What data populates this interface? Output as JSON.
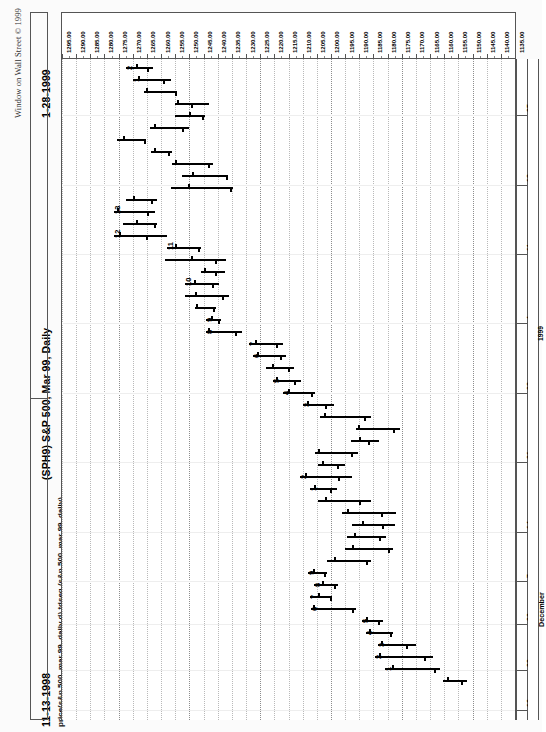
{
  "header": {
    "copyright": "Window on Wall Street © 1999",
    "end_date": "1-28-1999",
    "start_date": "11-13-1998",
    "symbol_title": "(SPH9)  S&P 500, Mar 99, Daily",
    "study_line": "price(s&p 500, mar 99, daily d)  tdseq (s&p 500, mar 99, daily)"
  },
  "chart_data": {
    "type": "bar",
    "subtype": "ohlc-bar-horizontal",
    "title": "(SPH9)  S&P 500, Mar 99, Daily",
    "subtitle": "price(s&p 500, mar 99, daily d)  tdseq (s&p 500, mar 99, daily)",
    "orientation": "rotated-90-ccw",
    "xlabel": "Price",
    "ylabel": "Date",
    "grid": true,
    "legend": "none",
    "date_range": [
      "11-13-1998",
      "1-28-1999"
    ],
    "ylim": [
      1135.0,
      1295.0
    ],
    "price_ticks": [
      "1295.00",
      "1290.00",
      "1285.00",
      "1280.00",
      "1275.00",
      "1270.00",
      "1265.00",
      "1260.00",
      "1255.00",
      "1250.00",
      "1245.00",
      "1240.00",
      "1235.00",
      "1230.00",
      "1225.00",
      "1220.00",
      "1215.00",
      "1210.00",
      "1205.00",
      "1200.00",
      "1195.00",
      "1190.00",
      "1185.00",
      "1180.00",
      "1175.00",
      "1170.00",
      "1165.00",
      "1160.00",
      "1155.00",
      "1150.00",
      "1145.00",
      "1140.00",
      "1135.00"
    ],
    "date_ticks": [
      {
        "label": "25",
        "pos": 0.085
      },
      {
        "label": "18",
        "pos": 0.19
      },
      {
        "label": "11",
        "pos": 0.295
      },
      {
        "label": "4",
        "pos": 0.4
      },
      {
        "label": "28",
        "pos": 0.505
      },
      {
        "label": "21",
        "pos": 0.61
      },
      {
        "label": "14",
        "pos": 0.715
      },
      {
        "label": "7",
        "pos": 0.79
      },
      {
        "label": "30",
        "pos": 0.855
      },
      {
        "label": "23",
        "pos": 0.925
      },
      {
        "label": "16",
        "pos": 0.985
      }
    ],
    "year_label": "1999",
    "month_label": "December",
    "bars": [
      {
        "i": 0,
        "high": 1272.5,
        "low": 1263.0,
        "open": 1269.0,
        "close": 1265.0,
        "td": "2"
      },
      {
        "i": 1,
        "high": 1270.0,
        "low": 1256.5,
        "open": 1268.0,
        "close": 1259.5,
        "td": "1"
      },
      {
        "i": 2,
        "high": 1266.0,
        "low": 1254.5,
        "open": 1265.5,
        "close": 1255.0,
        "td": ""
      },
      {
        "i": 3,
        "high": 1255.0,
        "low": 1243.0,
        "open": 1254.5,
        "close": 1249.5,
        "td": ""
      },
      {
        "i": 4,
        "high": 1255.0,
        "low": 1244.5,
        "open": 1250.0,
        "close": 1245.5,
        "td": ""
      },
      {
        "i": 5,
        "high": 1264.0,
        "low": 1250.0,
        "open": 1262.5,
        "close": 1252.5,
        "td": ""
      },
      {
        "i": 6,
        "high": 1275.5,
        "low": 1265.5,
        "open": 1273.5,
        "close": 1266.0,
        "td": ""
      },
      {
        "i": 7,
        "high": 1263.5,
        "low": 1256.0,
        "open": 1262.5,
        "close": 1257.5,
        "td": ""
      },
      {
        "i": 8,
        "high": 1256.0,
        "low": 1241.5,
        "open": 1255.0,
        "close": 1243.5,
        "td": ""
      },
      {
        "i": 9,
        "high": 1252.5,
        "low": 1236.5,
        "open": 1249.0,
        "close": 1237.0,
        "td": ""
      },
      {
        "i": 10,
        "high": 1256.5,
        "low": 1234.5,
        "open": 1250.5,
        "close": 1235.5,
        "td": ""
      },
      {
        "i": 11,
        "high": 1272.5,
        "low": 1261.5,
        "open": 1270.0,
        "close": 1263.5,
        "td": ""
      },
      {
        "i": 12,
        "high": 1276.5,
        "low": 1262.0,
        "open": 1275.5,
        "close": 1265.0,
        "td": "13"
      },
      {
        "i": 13,
        "high": 1273.5,
        "low": 1261.5,
        "open": 1269.0,
        "close": 1262.5,
        "td": ""
      },
      {
        "i": 14,
        "high": 1276.5,
        "low": 1258.0,
        "open": 1275.0,
        "close": 1265.5,
        "td": "12"
      },
      {
        "i": 15,
        "high": 1258.0,
        "low": 1246.0,
        "open": 1255.0,
        "close": 1247.0,
        "td": "11"
      },
      {
        "i": 16,
        "high": 1258.5,
        "low": 1237.0,
        "open": 1249.5,
        "close": 1241.0,
        "td": ""
      },
      {
        "i": 17,
        "high": 1246.0,
        "low": 1237.5,
        "open": 1245.0,
        "close": 1241.0,
        "td": ""
      },
      {
        "i": 18,
        "high": 1251.5,
        "low": 1239.5,
        "open": 1248.5,
        "close": 1242.0,
        "td": "10"
      },
      {
        "i": 19,
        "high": 1251.5,
        "low": 1236.0,
        "open": 1248.0,
        "close": 1238.5,
        "td": ""
      },
      {
        "i": 20,
        "high": 1248.0,
        "low": 1240.5,
        "open": 1247.5,
        "close": 1241.5,
        "td": ""
      },
      {
        "i": 21,
        "high": 1244.0,
        "low": 1239.0,
        "open": 1242.5,
        "close": 1240.0,
        "td": "9"
      },
      {
        "i": 22,
        "high": 1244.0,
        "low": 1231.5,
        "open": 1243.5,
        "close": 1234.0,
        "td": "8"
      },
      {
        "i": 23,
        "high": 1229.0,
        "low": 1217.0,
        "open": 1227.0,
        "close": 1219.5,
        "td": "7"
      },
      {
        "i": 24,
        "high": 1227.5,
        "low": 1216.0,
        "open": 1226.0,
        "close": 1218.0,
        "td": "6"
      },
      {
        "i": 25,
        "high": 1223.0,
        "low": 1213.0,
        "open": 1221.0,
        "close": 1215.0,
        "td": ""
      },
      {
        "i": 26,
        "high": 1220.5,
        "low": 1210.5,
        "open": 1219.5,
        "close": 1213.0,
        "td": "5"
      },
      {
        "i": 27,
        "high": 1217.0,
        "low": 1205.5,
        "open": 1215.0,
        "close": 1207.0,
        "td": "4"
      },
      {
        "i": 28,
        "high": 1210.0,
        "low": 1199.0,
        "open": 1208.5,
        "close": 1202.0,
        "td": "3"
      },
      {
        "i": 29,
        "high": 1204.0,
        "low": 1186.0,
        "open": 1202.5,
        "close": 1188.5,
        "td": ""
      },
      {
        "i": 30,
        "high": 1191.0,
        "low": 1175.5,
        "open": 1190.5,
        "close": 1178.0,
        "td": ""
      },
      {
        "i": 31,
        "high": 1193.0,
        "low": 1183.0,
        "open": 1190.0,
        "close": 1187.0,
        "td": ""
      },
      {
        "i": 32,
        "high": 1205.5,
        "low": 1190.5,
        "open": 1204.5,
        "close": 1193.0,
        "td": ""
      },
      {
        "i": 33,
        "high": 1204.5,
        "low": 1195.0,
        "open": 1203.0,
        "close": 1198.0,
        "td": ""
      },
      {
        "i": 34,
        "high": 1211.0,
        "low": 1192.5,
        "open": 1209.0,
        "close": 1197.5,
        "td": "2"
      },
      {
        "i": 35,
        "high": 1207.5,
        "low": 1198.0,
        "open": 1206.0,
        "close": 1200.5,
        "td": "1"
      },
      {
        "i": 36,
        "high": 1204.5,
        "low": 1186.0,
        "open": 1202.0,
        "close": 1190.0,
        "td": ""
      },
      {
        "i": 37,
        "high": 1196.0,
        "low": 1177.0,
        "open": 1194.5,
        "close": 1182.5,
        "td": ""
      },
      {
        "i": 38,
        "high": 1192.5,
        "low": 1177.5,
        "open": 1189.0,
        "close": 1182.0,
        "td": ""
      },
      {
        "i": 39,
        "high": 1194.5,
        "low": 1180.5,
        "open": 1192.0,
        "close": 1183.0,
        "td": ""
      },
      {
        "i": 40,
        "high": 1195.0,
        "low": 1178.0,
        "open": 1192.5,
        "close": 1180.0,
        "td": ""
      },
      {
        "i": 41,
        "high": 1201.5,
        "low": 1186.0,
        "open": 1199.0,
        "close": 1187.5,
        "td": ""
      },
      {
        "i": 42,
        "high": 1208.0,
        "low": 1201.5,
        "open": 1206.5,
        "close": 1202.5,
        "td": "9"
      },
      {
        "i": 43,
        "high": 1206.0,
        "low": 1197.5,
        "open": 1203.0,
        "close": 1199.0,
        "td": "8"
      },
      {
        "i": 44,
        "high": 1207.5,
        "low": 1199.5,
        "open": 1204.5,
        "close": 1200.5,
        "td": "7"
      },
      {
        "i": 45,
        "high": 1207.0,
        "low": 1191.0,
        "open": 1206.5,
        "close": 1192.5,
        "td": "6"
      },
      {
        "i": 46,
        "high": 1189.0,
        "low": 1181.5,
        "open": 1187.5,
        "close": 1183.5,
        "td": "5"
      },
      {
        "i": 47,
        "high": 1187.5,
        "low": 1178.0,
        "open": 1186.5,
        "close": 1179.0,
        "td": "4"
      },
      {
        "i": 48,
        "high": 1183.5,
        "low": 1170.0,
        "open": 1182.5,
        "close": 1173.5,
        "td": "3"
      },
      {
        "i": 49,
        "high": 1184.5,
        "low": 1164.0,
        "open": 1183.0,
        "close": 1167.0,
        "td": "2"
      },
      {
        "i": 50,
        "high": 1181.0,
        "low": 1161.5,
        "open": 1178.5,
        "close": 1163.5,
        "td": "1"
      },
      {
        "i": 51,
        "high": 1160.5,
        "low": 1152.0,
        "open": 1159.0,
        "close": 1154.0,
        "td": ""
      }
    ]
  }
}
